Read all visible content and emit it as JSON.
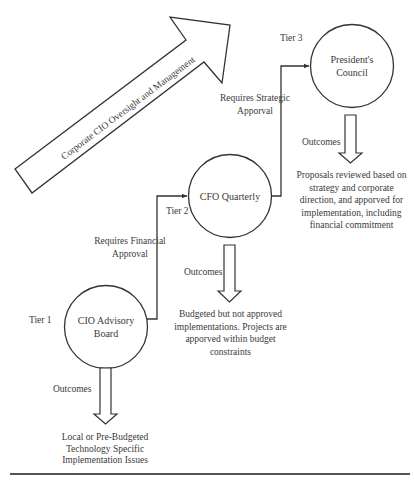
{
  "diagram": {
    "colors": {
      "stroke": "#333333",
      "text": "#3a3a3a",
      "background": "#ffffff"
    },
    "big_arrow": {
      "label": "Corporate CIO Oversight and Management"
    },
    "tiers": [
      {
        "tier_label": "Tier 1",
        "node_line1": "CIO Advisory",
        "node_line2": "Board",
        "outcomes_label": "Outcomes",
        "outcome_lines": [
          "Local or Pre-Budgeted",
          "Technology Specific",
          "Implementation Issues"
        ]
      },
      {
        "tier_label": "Tier 2",
        "node_line1": "CFO Quarterly",
        "requirement_lines": [
          "Requires Financial",
          "Approval"
        ],
        "outcomes_label": "Outcomes",
        "outcome_lines": [
          "Budgeted but not approved",
          "implementations. Projects are",
          "apporved within budget",
          "constraints"
        ]
      },
      {
        "tier_label": "Tier 3",
        "node_line1": "President's",
        "node_line2": "Council",
        "requirement_lines": [
          "Requires Strategic",
          "Apporval"
        ],
        "outcomes_label": "Outcomes",
        "outcome_lines": [
          "Proposals reviewed based on",
          "strategy and corporate",
          "direction, and apporved for",
          "implementation, including",
          "financial commitment"
        ]
      }
    ]
  }
}
